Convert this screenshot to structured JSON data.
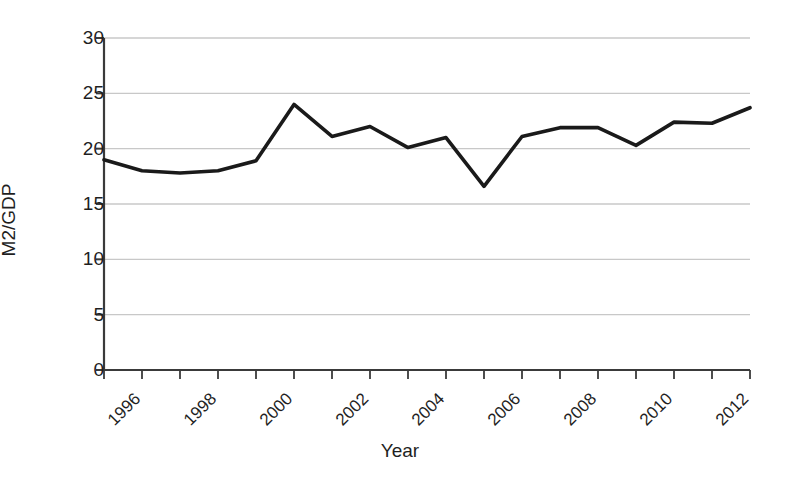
{
  "chart_data": {
    "type": "line",
    "title": "",
    "xlabel": "Year",
    "ylabel": "M2/GDP",
    "xlim": [
      1995,
      2012
    ],
    "ylim": [
      0,
      30
    ],
    "grid": true,
    "legend": null,
    "y_ticks": [
      0,
      5,
      10,
      15,
      20,
      25,
      30
    ],
    "y_tick_labels": [
      "0",
      "5",
      "10",
      "15",
      "20",
      "25",
      "30"
    ],
    "x_ticks": [
      1995,
      1996,
      1997,
      1998,
      1999,
      2000,
      2001,
      2002,
      2003,
      2004,
      2005,
      2006,
      2007,
      2008,
      2009,
      2010,
      2011,
      2012
    ],
    "x_tick_labels": [
      "",
      "1996",
      "",
      "1998",
      "",
      "2000",
      "",
      "2002",
      "",
      "2004",
      "",
      "2006",
      "",
      "2008",
      "",
      "2010",
      "",
      "2012"
    ],
    "x": [
      1995,
      1996,
      1997,
      1998,
      1999,
      2000,
      2001,
      2002,
      2003,
      2004,
      2005,
      2006,
      2007,
      2008,
      2009,
      2010,
      2011,
      2012
    ],
    "values": [
      19.0,
      18.0,
      17.8,
      18.0,
      18.9,
      24.0,
      21.1,
      22.0,
      20.1,
      21.0,
      16.6,
      21.1,
      21.9,
      21.9,
      20.3,
      22.4,
      22.3,
      23.7
    ],
    "series": [
      {
        "name": "M2/GDP",
        "color": "#1a1a1a",
        "values": [
          19.0,
          18.0,
          17.8,
          18.0,
          18.9,
          24.0,
          21.1,
          22.0,
          20.1,
          21.0,
          16.6,
          21.1,
          21.9,
          21.9,
          20.3,
          22.4,
          22.3,
          23.7
        ]
      }
    ],
    "colors": {
      "line": "#1a1a1a",
      "grid": "#c8c8c8",
      "axis": "#3a3a3a",
      "text": "#1f1f1f",
      "background": "#ffffff"
    }
  }
}
